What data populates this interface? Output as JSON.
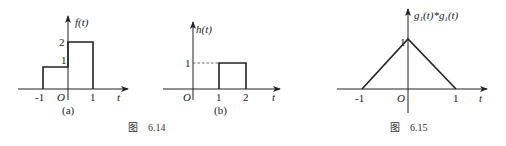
{
  "figure_6_14": {
    "caption": "图　6.14",
    "panel_a": {
      "sublabel": "(a)",
      "y_label": "f(t)",
      "x_label": "t",
      "origin_label": "O",
      "x_ticks": [
        "-1",
        "1"
      ],
      "y_ticks": [
        "1",
        "2"
      ],
      "segments": [
        {
          "from": -1,
          "to": 0,
          "value": 1
        },
        {
          "from": 0,
          "to": 1,
          "value": 2
        }
      ]
    },
    "panel_b": {
      "sublabel": "(b)",
      "y_label": "h(t)",
      "x_label": "t",
      "origin_label": "O",
      "x_ticks": [
        "1",
        "2"
      ],
      "y_ticks": [
        "1"
      ],
      "segments": [
        {
          "from": 1,
          "to": 2,
          "value": 1
        }
      ]
    }
  },
  "figure_6_15": {
    "caption": "图　6.15",
    "y_label": "g1(t)*g1(t)",
    "y_label_parts": {
      "g": "g",
      "sub": "1",
      "arg": "(t)",
      "star": "*"
    },
    "x_label": "t",
    "origin_label": "O",
    "x_ticks": [
      "-1",
      "1"
    ],
    "y_ticks": [
      "1"
    ],
    "points": [
      [
        -1,
        0
      ],
      [
        0,
        1
      ],
      [
        1,
        0
      ]
    ]
  }
}
